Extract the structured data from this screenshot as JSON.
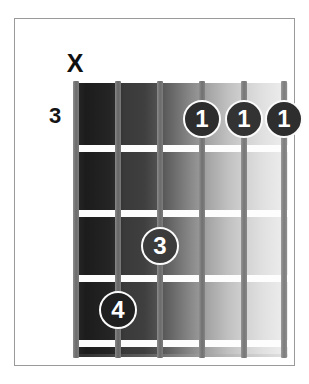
{
  "diagram": {
    "type": "guitar-chord-diagram",
    "start_fret_label": "3",
    "mute_marker": "X",
    "strings": [
      {
        "index": 1,
        "name": "string-1"
      },
      {
        "index": 2,
        "name": "string-2"
      },
      {
        "index": 3,
        "name": "string-3"
      },
      {
        "index": 4,
        "name": "string-4"
      },
      {
        "index": 5,
        "name": "string-5"
      },
      {
        "index": 6,
        "name": "string-6"
      }
    ],
    "fret_lines": [
      {
        "index": 1
      },
      {
        "index": 2
      },
      {
        "index": 3
      },
      {
        "index": 4
      }
    ],
    "finger_positions": [
      {
        "label": "1",
        "string": 4,
        "fret": 1
      },
      {
        "label": "1",
        "string": 5,
        "fret": 1
      },
      {
        "label": "1",
        "string": 6,
        "fret": 1
      },
      {
        "label": "3",
        "string": 3,
        "fret": 3
      },
      {
        "label": "4",
        "string": 2,
        "fret": 4
      }
    ],
    "colors": {
      "marker_fill": "#2f2f2f",
      "marker_text": "#ffffff",
      "marker_ring": "#fbfbfb",
      "fret_line": "#fdfdfd",
      "frame": "#9a9a9a",
      "label_text": "#141414",
      "board_dark": "#1c1c1c",
      "board_light": "#ededed"
    }
  }
}
